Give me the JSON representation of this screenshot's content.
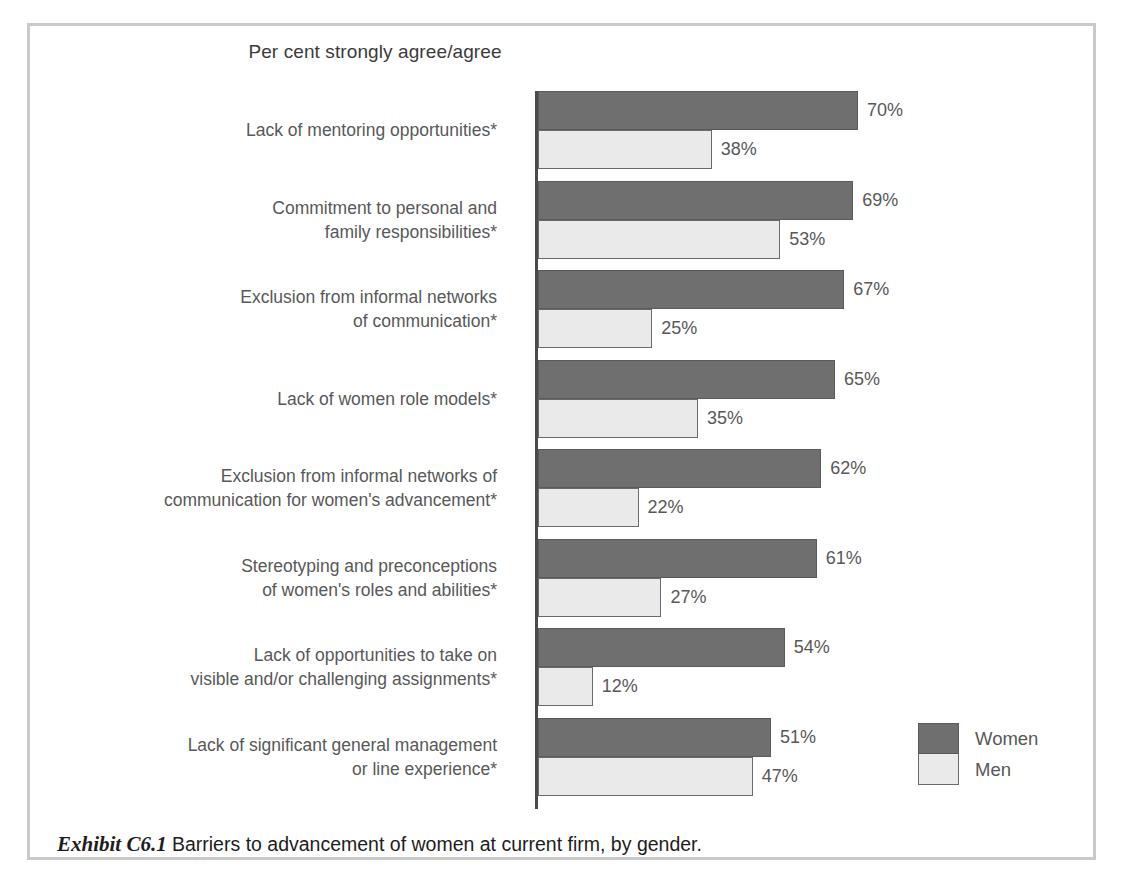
{
  "chart_data": {
    "type": "bar",
    "orientation": "horizontal",
    "title": "Per cent strongly agree/agree",
    "xlabel": "",
    "ylabel": "",
    "xlim": [
      0,
      70
    ],
    "grid": false,
    "legend_position": "bottom-right",
    "categories": [
      "Lack of mentoring opportunities*",
      "Commitment to personal and\nfamily responsibilities*",
      "Exclusion from informal networks\nof communication*",
      "Lack of women role models*",
      "Exclusion from informal networks of\ncommunication for women's advancement*",
      "Stereotyping and preconceptions\nof women's roles and abilities*",
      "Lack of opportunities to take on\nvisible and/or challenging assignments*",
      "Lack of significant general management\nor line experience*"
    ],
    "series": [
      {
        "name": "Women",
        "color": "#6f6f6f",
        "values": [
          70,
          69,
          67,
          65,
          62,
          61,
          54,
          51
        ],
        "labels": [
          "70%",
          "69%",
          "67%",
          "65%",
          "62%",
          "61%",
          "54%",
          "51%"
        ]
      },
      {
        "name": "Men",
        "color": "#eaeaea",
        "values": [
          38,
          53,
          25,
          35,
          22,
          27,
          12,
          47
        ],
        "labels": [
          "38%",
          "53%",
          "25%",
          "35%",
          "22%",
          "27%",
          "12%",
          "47%"
        ]
      }
    ]
  },
  "legend": {
    "items": [
      {
        "label": "Women",
        "color": "#6f6f6f"
      },
      {
        "label": "Men",
        "color": "#eaeaea"
      }
    ]
  },
  "caption": {
    "exhibit": "Exhibit C6.1",
    "text": "Barriers to advancement of women at current firm, by gender."
  },
  "colors": {
    "women_fill": "#6f6f6f",
    "men_fill": "#eaeaea",
    "bar_stroke": "#5a5a5a",
    "axis": "#4a4a4a",
    "frame": "#c9c9c9",
    "label_text": "#58585a",
    "caption_text": "#1d1d1d"
  }
}
